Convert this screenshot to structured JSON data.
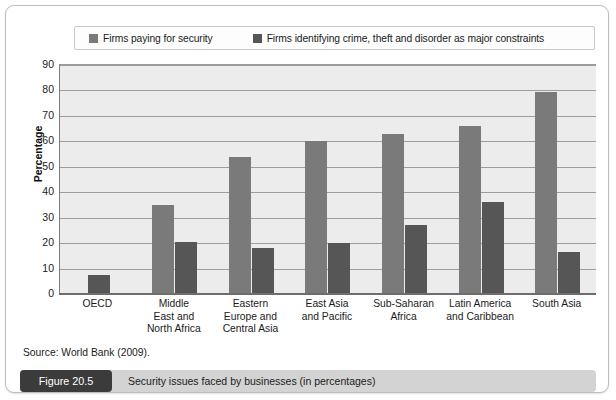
{
  "figure": {
    "number_label": "Figure 20.5",
    "caption": "Security issues faced by businesses (in percentages)",
    "source": "Source: World Bank (2009)."
  },
  "colors": {
    "series_0": "#7a7a7a",
    "series_1": "#565656",
    "plot_background": "#ececec",
    "gridline": "#9d9d9d",
    "caption_bar": "#d3d3d3",
    "figure_number_bg": "#3b3b3b"
  },
  "chart_data": {
    "type": "bar",
    "title": "Security issues faced by businesses (in percentages)",
    "xlabel": "",
    "ylabel": "Percentage",
    "ylim": [
      0,
      90
    ],
    "yticks": [
      0,
      10,
      20,
      30,
      40,
      50,
      60,
      70,
      80,
      90
    ],
    "grid": true,
    "legend_position": "top",
    "categories": [
      "OECD",
      "Middle East and North Africa",
      "Eastern Europe and Central Asia",
      "East Asia and Pacific",
      "Sub-Saharan Africa",
      "Latin America and Caribbean",
      "South Asia"
    ],
    "category_lines": [
      [
        "OECD"
      ],
      [
        "Middle",
        "East and",
        "North Africa"
      ],
      [
        "Eastern",
        "Europe and",
        "Central Asia"
      ],
      [
        "East Asia",
        "and Pacific"
      ],
      [
        "Sub-Saharan",
        "Africa"
      ],
      [
        "Latin America",
        "and Caribbean"
      ],
      [
        "South Asia"
      ]
    ],
    "series": [
      {
        "name": "Firms paying for security",
        "color": "#7a7a7a",
        "values": [
          null,
          35,
          54,
          60,
          63,
          66,
          79.5
        ]
      },
      {
        "name": "Firms identifying crime, theft and disorder as major constraints",
        "color": "#565656",
        "values": [
          7.5,
          20.5,
          18,
          20,
          27,
          36,
          16.5
        ]
      }
    ]
  },
  "legend": {
    "entries": [
      {
        "label": "Firms paying for security"
      },
      {
        "label": "Firms identifying crime, theft and disorder as major constraints"
      }
    ]
  }
}
